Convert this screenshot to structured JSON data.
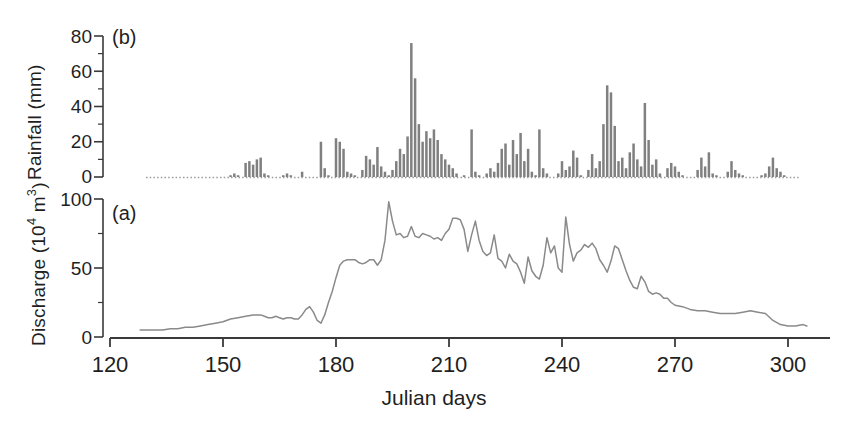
{
  "figure": {
    "xaxis_title": "Julian days",
    "panel_a_tag": "(a)",
    "panel_b_tag": "(b)",
    "axis_color": "#3a3a3a",
    "bar_color": "#808080",
    "line_color": "#8a8a8a"
  },
  "axes": {
    "x_ticks": [
      "120",
      "150",
      "180",
      "210",
      "240",
      "270",
      "300"
    ],
    "y_ticks_rainfall": [
      "80",
      "60",
      "40",
      "20",
      "0"
    ],
    "y_ticks_discharge": [
      "100",
      "50",
      "0"
    ],
    "ylabel_rainfall": "Rainfall (mm)",
    "ylabel_discharge_pre": "Discharge (10",
    "ylabel_discharge_sup": "4",
    "ylabel_discharge_post": " m",
    "ylabel_discharge_sup2": "3",
    "ylabel_discharge_end": ")"
  },
  "chart_data": [
    {
      "type": "bar",
      "panel": "b",
      "title": "(b) Rainfall",
      "xlabel": "Julian days",
      "ylabel": "Rainfall (mm)",
      "xlim": [
        120,
        310
      ],
      "ylim": [
        0,
        80
      ],
      "ytick_values": [
        0,
        20,
        40,
        60,
        80
      ],
      "yminor_step": 10,
      "xtick_values": [
        120,
        150,
        180,
        210,
        240,
        270,
        300
      ],
      "grid": false,
      "legend": "none",
      "x": [
        127,
        128,
        129,
        130,
        131,
        132,
        133,
        134,
        135,
        136,
        137,
        138,
        139,
        140,
        141,
        142,
        143,
        144,
        145,
        146,
        147,
        148,
        149,
        150,
        151,
        152,
        153,
        154,
        155,
        156,
        157,
        158,
        159,
        160,
        161,
        162,
        163,
        164,
        165,
        166,
        167,
        168,
        169,
        170,
        171,
        172,
        173,
        174,
        175,
        176,
        177,
        178,
        179,
        180,
        181,
        182,
        183,
        184,
        185,
        186,
        187,
        188,
        189,
        190,
        191,
        192,
        193,
        194,
        195,
        196,
        197,
        198,
        199,
        200,
        201,
        202,
        203,
        204,
        205,
        206,
        207,
        208,
        209,
        210,
        211,
        212,
        213,
        214,
        215,
        216,
        217,
        218,
        219,
        220,
        221,
        222,
        223,
        224,
        225,
        226,
        227,
        228,
        229,
        230,
        231,
        232,
        233,
        234,
        235,
        236,
        237,
        238,
        239,
        240,
        241,
        242,
        243,
        244,
        245,
        246,
        247,
        248,
        249,
        250,
        251,
        252,
        253,
        254,
        255,
        256,
        257,
        258,
        259,
        260,
        261,
        262,
        263,
        264,
        265,
        266,
        267,
        268,
        269,
        270,
        271,
        272,
        273,
        274,
        275,
        276,
        277,
        278,
        279,
        280,
        281,
        282,
        283,
        284,
        285,
        286,
        287,
        288,
        289,
        290,
        291,
        292,
        293,
        294,
        295,
        296,
        297,
        298,
        299,
        300,
        301,
        302,
        303,
        304,
        305
      ],
      "values": [
        0,
        0,
        0,
        0,
        0,
        0,
        0,
        0,
        0,
        0,
        0,
        0,
        0,
        0,
        0,
        0,
        0,
        0,
        0,
        0,
        0,
        0,
        0,
        0,
        0,
        1,
        2,
        1,
        0,
        8,
        9,
        7,
        10,
        11,
        2,
        1,
        0,
        0,
        0,
        1,
        2,
        1,
        0,
        0,
        3,
        0,
        0,
        0,
        0,
        20,
        5,
        1,
        0,
        22,
        20,
        16,
        3,
        2,
        1,
        0,
        4,
        12,
        10,
        7,
        17,
        6,
        3,
        1,
        4,
        9,
        16,
        13,
        23,
        76,
        56,
        30,
        20,
        26,
        22,
        27,
        21,
        13,
        10,
        7,
        5,
        2,
        0,
        1,
        0,
        27,
        3,
        1,
        0,
        2,
        5,
        3,
        8,
        16,
        19,
        7,
        21,
        13,
        25,
        9,
        16,
        3,
        1,
        27,
        5,
        2,
        0,
        0,
        2,
        9,
        4,
        6,
        15,
        11,
        1,
        0,
        4,
        13,
        5,
        9,
        30,
        52,
        48,
        29,
        9,
        11,
        5,
        14,
        19,
        10,
        6,
        42,
        21,
        7,
        10,
        2,
        0,
        5,
        8,
        6,
        3,
        1,
        0,
        0,
        0,
        4,
        11,
        6,
        14,
        2,
        1,
        0,
        0,
        3,
        9,
        4,
        2,
        1,
        0,
        0,
        0,
        0,
        1,
        2,
        6,
        11,
        5,
        3,
        1,
        0,
        0,
        0,
        0,
        0,
        0,
        0
      ]
    },
    {
      "type": "line",
      "panel": "a",
      "title": "(a) Discharge",
      "xlabel": "Julian days",
      "ylabel": "Discharge (10^4 m^3)",
      "xlim": [
        120,
        310
      ],
      "ylim": [
        0,
        100
      ],
      "ytick_values": [
        0,
        50,
        100
      ],
      "yminor_step": 25,
      "xtick_values": [
        120,
        150,
        180,
        210,
        240,
        270,
        300
      ],
      "grid": false,
      "legend": "none",
      "x": [
        128,
        130,
        132,
        134,
        136,
        138,
        140,
        142,
        144,
        146,
        148,
        150,
        152,
        154,
        156,
        158,
        160,
        161,
        162,
        163,
        164,
        165,
        166,
        167,
        168,
        169,
        170,
        171,
        172,
        173,
        174,
        175,
        176,
        177,
        178,
        179,
        180,
        181,
        182,
        183,
        184,
        185,
        186,
        187,
        188,
        189,
        190,
        191,
        192,
        193,
        194,
        195,
        196,
        197,
        198,
        199,
        200,
        201,
        202,
        203,
        204,
        205,
        206,
        207,
        208,
        209,
        210,
        211,
        212,
        213,
        214,
        215,
        216,
        217,
        218,
        219,
        220,
        221,
        222,
        223,
        224,
        225,
        226,
        227,
        228,
        229,
        230,
        231,
        232,
        233,
        234,
        235,
        236,
        237,
        238,
        239,
        240,
        241,
        242,
        243,
        244,
        245,
        246,
        247,
        248,
        249,
        250,
        251,
        252,
        253,
        254,
        255,
        256,
        257,
        258,
        259,
        260,
        261,
        262,
        263,
        264,
        265,
        266,
        267,
        268,
        269,
        270,
        272,
        274,
        276,
        278,
        280,
        282,
        284,
        286,
        288,
        290,
        292,
        294,
        296,
        298,
        300,
        302,
        304,
        305
      ],
      "values": [
        5,
        5,
        5,
        5,
        6,
        6,
        7,
        7,
        8,
        9,
        10,
        11,
        13,
        14,
        15,
        16,
        16,
        15,
        14,
        14,
        15,
        14,
        13,
        14,
        14,
        13,
        13,
        16,
        20,
        22,
        18,
        12,
        10,
        16,
        25,
        33,
        43,
        52,
        55,
        56,
        56,
        56,
        54,
        53,
        54,
        56,
        56,
        52,
        56,
        70,
        98,
        84,
        74,
        75,
        72,
        73,
        80,
        73,
        72,
        75,
        74,
        73,
        71,
        72,
        70,
        75,
        78,
        86,
        86,
        85,
        78,
        62,
        74,
        84,
        70,
        62,
        59,
        61,
        74,
        57,
        55,
        50,
        60,
        55,
        53,
        47,
        39,
        58,
        48,
        44,
        42,
        52,
        72,
        61,
        66,
        50,
        47,
        87,
        67,
        55,
        61,
        63,
        67,
        65,
        68,
        64,
        56,
        52,
        47,
        55,
        66,
        64,
        56,
        48,
        41,
        36,
        35,
        44,
        40,
        33,
        31,
        32,
        31,
        28,
        28,
        25,
        23,
        22,
        20,
        19,
        19,
        18,
        17,
        17,
        17,
        18,
        19,
        18,
        17,
        12,
        9,
        8,
        8,
        9,
        8
      ]
    }
  ]
}
